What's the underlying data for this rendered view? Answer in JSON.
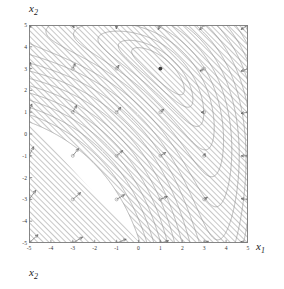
{
  "figure": {
    "type": "contour-with-gradient-field",
    "top_label": "x",
    "top_label_sub": "2",
    "x_axis_label": "x",
    "x_axis_label_sub": "1",
    "bottom_label": "x",
    "bottom_label_sub": "2"
  },
  "chart_data": {
    "type": "line",
    "title": "",
    "xlabel": "x1",
    "ylabel": "x2",
    "xlim": [
      -5,
      5
    ],
    "ylim": [
      -5,
      5
    ],
    "grid": false,
    "legend": "none",
    "xticks": [
      "-5",
      "-4",
      "-3",
      "-2",
      "-1",
      "0",
      "1",
      "2",
      "3",
      "4",
      "5"
    ],
    "yticks": [
      "5",
      "4",
      "3",
      "2",
      "1",
      "0",
      "-1",
      "-2",
      "-3",
      "-4",
      "-5"
    ],
    "xtick_values": [
      -5,
      -4,
      -3,
      -2,
      -1,
      0,
      1,
      2,
      3,
      4,
      5
    ],
    "ytick_values": [
      5,
      4,
      3,
      2,
      1,
      0,
      -1,
      -2,
      -3,
      -4,
      -5
    ],
    "contour_description": "Nested banana-shaped level curves of a quadratic-like objective; valley axis runs from lower-left to upper-right; shaded hatched regions lie outside the outermost contour.",
    "contour_levels": [
      1,
      2,
      4,
      7,
      11,
      16,
      22,
      29,
      37,
      46,
      56,
      67,
      79,
      92,
      106,
      121
    ],
    "minimum_marker": {
      "x": 1.0,
      "y": 3.0,
      "style": "filled-dot"
    },
    "gradient_field": {
      "description": "Arrows at integer grid points spaced 2 units apart, pointing toward the valley (negative gradient direction), lengths scale with gradient magnitude.",
      "grid_spacing": 2,
      "grid_x": [
        -5,
        -3,
        -1,
        1,
        3,
        5
      ],
      "grid_y": [
        5,
        3,
        1,
        -1,
        -3,
        -5
      ],
      "base_marker": "open-circle"
    },
    "shading": {
      "pattern": "diagonal-hatch-45deg",
      "color": "#9a9a9a"
    }
  }
}
